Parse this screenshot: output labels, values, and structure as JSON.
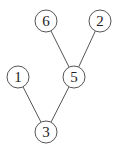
{
  "diagram": {
    "type": "tree",
    "nodes": [
      {
        "id": "6",
        "label": "6",
        "x": 46,
        "y": 21
      },
      {
        "id": "2",
        "label": "2",
        "x": 100,
        "y": 21
      },
      {
        "id": "1",
        "label": "1",
        "x": 18,
        "y": 77
      },
      {
        "id": "5",
        "label": "5",
        "x": 74,
        "y": 77
      },
      {
        "id": "3",
        "label": "3",
        "x": 46,
        "y": 132
      }
    ],
    "edges": [
      {
        "from": "6",
        "to": "5"
      },
      {
        "from": "2",
        "to": "5"
      },
      {
        "from": "1",
        "to": "3"
      },
      {
        "from": "5",
        "to": "3"
      }
    ]
  }
}
